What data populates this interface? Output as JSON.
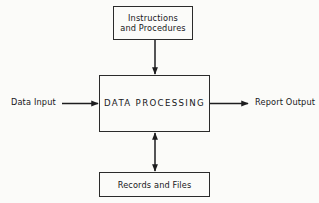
{
  "diagram": {
    "background_color": "#fbfbf9",
    "line_color": "#1d1d1f",
    "text_color": "#17171a",
    "boxes": [
      {
        "id": "instructions",
        "label": "Instructions\nand Procedures",
        "x": 113,
        "y": 6,
        "width": 80,
        "height": 34
      },
      {
        "id": "processing",
        "label": "DATA PROCESSING",
        "x": 99,
        "y": 75,
        "width": 111,
        "height": 57
      },
      {
        "id": "records",
        "label": "Records and Files",
        "x": 99,
        "y": 172,
        "width": 111,
        "height": 25
      }
    ],
    "labels": [
      {
        "id": "data-input",
        "text": "Data Input",
        "x": 11,
        "y": 97
      },
      {
        "id": "report-output",
        "text": "Report Output",
        "x": 255,
        "y": 97
      }
    ],
    "connectors": [
      {
        "id": "instructions-to-processing",
        "from": "instructions",
        "to": "processing",
        "orientation": "vertical",
        "arrowheads": "end",
        "x1": 155,
        "y1": 40,
        "x2": 155,
        "y2": 75
      },
      {
        "id": "data-input-to-processing",
        "from": "data-input",
        "to": "processing",
        "orientation": "horizontal",
        "arrowheads": "end",
        "x1": 62,
        "y1": 103.5,
        "x2": 99,
        "y2": 103.5
      },
      {
        "id": "processing-to-report-output",
        "from": "processing",
        "to": "report-output",
        "orientation": "horizontal",
        "arrowheads": "end",
        "x1": 210,
        "y1": 103.5,
        "x2": 249,
        "y2": 103.5
      },
      {
        "id": "processing-records-bidirectional",
        "from": "processing",
        "to": "records",
        "orientation": "vertical",
        "arrowheads": "both",
        "x1": 155,
        "y1": 132,
        "x2": 155,
        "y2": 172
      }
    ]
  }
}
